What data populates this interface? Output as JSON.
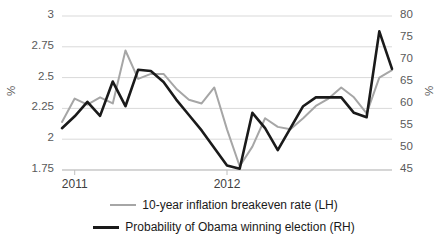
{
  "chart_data": {
    "type": "line",
    "title": "",
    "xlabel": "",
    "grid": true,
    "legend_position": "bottom",
    "x_tick_labels": [
      "2011",
      "2012"
    ],
    "axes": {
      "left": {
        "label": "%",
        "min": 1.75,
        "max": 3,
        "step": 0.25,
        "ticks": [
          "1.75",
          "2",
          "2.25",
          "2.5",
          "2.75",
          "3"
        ]
      },
      "right": {
        "label": "%",
        "min": 45,
        "max": 80,
        "step": 5,
        "ticks": [
          "45",
          "50",
          "55",
          "60",
          "65",
          "70",
          "75",
          "80"
        ]
      }
    },
    "series": [
      {
        "name": "10-year inflation breakeven rate (LH)",
        "axis": "left",
        "color": "#a6a6a6",
        "width": 2,
        "values": [
          2.14,
          2.33,
          2.28,
          2.34,
          2.29,
          2.72,
          2.49,
          2.53,
          2.53,
          2.41,
          2.32,
          2.29,
          2.42,
          2.08,
          1.78,
          1.94,
          2.17,
          2.1,
          2.08,
          2.17,
          2.27,
          2.33,
          2.42,
          2.34,
          2.21,
          2.5,
          2.56
        ]
      },
      {
        "name": "Probability of Obama winning election (RH)",
        "axis": "right",
        "color": "#1a1a1a",
        "width": 2.6,
        "values": [
          54.5,
          57.2,
          60.5,
          57.3,
          65.1,
          59.5,
          67.8,
          67.5,
          65.0,
          61.0,
          57.5,
          54.0,
          50.0,
          46.0,
          45.3,
          58.0,
          54.5,
          49.5,
          54.5,
          59.5,
          61.5,
          61.5,
          61.5,
          58.0,
          57.0,
          76.5,
          68.0
        ]
      }
    ],
    "legend": [
      {
        "label": "10-year inflation breakeven rate (LH)",
        "color": "#a6a6a6",
        "thickness": 2
      },
      {
        "label": "Probability of Obama winning election (RH)",
        "color": "#1a1a1a",
        "thickness": 3
      }
    ]
  }
}
